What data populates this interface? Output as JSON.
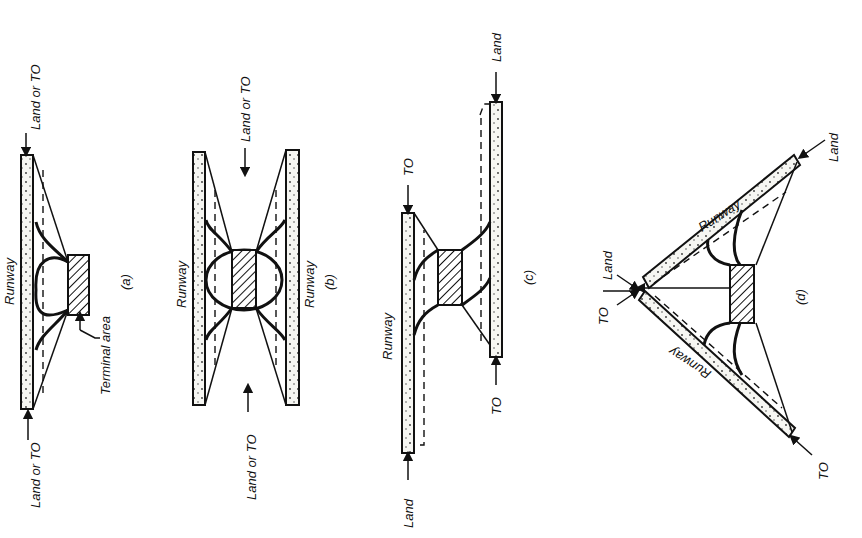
{
  "figure": {
    "panels": [
      {
        "id": "a",
        "caption": "(a)",
        "runway_label": "Runway",
        "terminal_label": "Terminal area",
        "end_labels": {
          "top": "Land or TO",
          "bottom": "Land or TO"
        }
      },
      {
        "id": "b",
        "caption": "(b)",
        "runway_labels": [
          "Runway",
          "Runway"
        ],
        "end_labels": {
          "top": "Land or TO",
          "bottom": "Land or TO"
        }
      },
      {
        "id": "c",
        "caption": "(c)",
        "runway_label": "Runway",
        "end_labels": {
          "left_top": "TO",
          "left_bottom": "Land",
          "right_top": "Land",
          "right_bottom": "TO"
        }
      },
      {
        "id": "d",
        "caption": "(d)",
        "runway_labels": [
          "Runway",
          "Runway"
        ],
        "end_labels": {
          "upper": "Land",
          "apex_land": "Land",
          "apex_to": "TO",
          "lower": "TO"
        }
      }
    ]
  }
}
